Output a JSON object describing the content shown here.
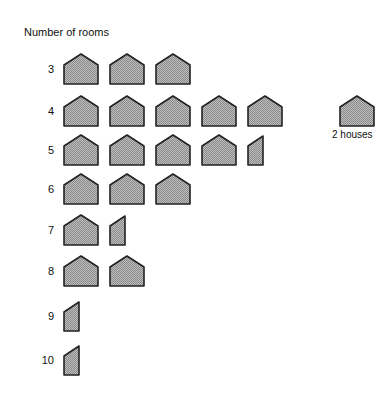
{
  "chart_data": {
    "type": "pictograph",
    "title": "Number of rooms",
    "ylabel": "Number of rooms",
    "unit": "houses",
    "legend": {
      "icon": "house-icon",
      "label": "2 houses",
      "value_per_icon": 2
    },
    "categories": [
      "3",
      "4",
      "5",
      "6",
      "7",
      "8",
      "9",
      "10"
    ],
    "icons": [
      3,
      5,
      4.5,
      3,
      1.5,
      2,
      0.5,
      0.5
    ],
    "values": [
      6,
      10,
      9,
      6,
      3,
      4,
      1,
      1
    ]
  },
  "title": "Number of rooms",
  "legend_label": "2 houses",
  "rows": [
    {
      "label": "3",
      "icons": 3
    },
    {
      "label": "4",
      "icons": 5
    },
    {
      "label": "5",
      "icons": 4.5
    },
    {
      "label": "6",
      "icons": 3
    },
    {
      "label": "7",
      "icons": 1.5
    },
    {
      "label": "8",
      "icons": 2
    },
    {
      "label": "9",
      "icons": 0.5
    },
    {
      "label": "10",
      "icons": 0.5
    }
  ],
  "colors": {
    "fill": "#a9a9a9",
    "stroke": "#222222"
  }
}
